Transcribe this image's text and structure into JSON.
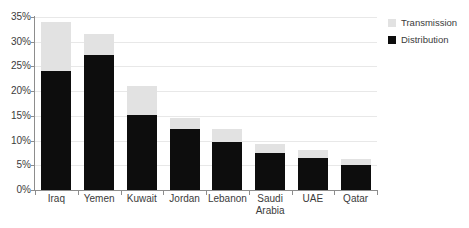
{
  "chart_data": {
    "type": "bar",
    "subtype": "stacked-vertical",
    "title": "",
    "xlabel": "",
    "ylabel": "",
    "ylim": [
      0,
      35
    ],
    "ytick_step": 5,
    "ytick_labels": [
      "0%",
      "5%",
      "10%",
      "15%",
      "20%",
      "25%",
      "30%",
      "35%"
    ],
    "ytick_values": [
      0,
      5,
      10,
      15,
      20,
      25,
      30,
      35
    ],
    "grid": true,
    "value_unit": "%",
    "legend_position": "top-right",
    "categories": [
      "Iraq",
      "Yemen",
      "Kuwait",
      "Jordan",
      "Lebanon",
      "Saudi Arabia",
      "UAE",
      "Qatar"
    ],
    "category_label_lines": [
      [
        "Iraq"
      ],
      [
        "Yemen"
      ],
      [
        "Kuwait"
      ],
      [
        "Jordan"
      ],
      [
        "Lebanon"
      ],
      [
        "Saudi",
        "Arabia"
      ],
      [
        "UAE"
      ],
      [
        "Qatar"
      ]
    ],
    "series": [
      {
        "name": "Distribution",
        "color": "#0d0d0d",
        "values": [
          24.0,
          27.3,
          15.2,
          12.3,
          9.7,
          7.4,
          6.5,
          5.0
        ]
      },
      {
        "name": "Transmission",
        "color": "#e2e2e2",
        "values": [
          10.0,
          4.2,
          5.9,
          2.2,
          2.6,
          2.0,
          1.5,
          1.3
        ]
      }
    ],
    "totals": [
      34.0,
      31.5,
      21.1,
      14.5,
      12.3,
      9.4,
      8.0,
      6.3
    ],
    "stack_order": [
      "Distribution",
      "Transmission"
    ]
  },
  "legend": {
    "items": [
      {
        "label": "Transmission",
        "swatch": "transmission"
      },
      {
        "label": "Distribution",
        "swatch": "distribution"
      }
    ]
  },
  "colors": {
    "transmission": "#e2e2e2",
    "distribution": "#0d0d0d",
    "axis": "#8d8d8d",
    "grid": "#e8e8e8",
    "text": "#3b3b3b",
    "background": "#ffffff"
  }
}
